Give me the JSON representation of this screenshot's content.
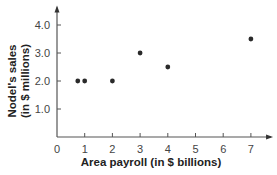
{
  "chart_data": {
    "type": "scatter",
    "title": "",
    "xlabel": "Area payroll (in $ billions)",
    "ylabel_line1": "Nodel's sales",
    "ylabel_line2": "(in $ millions)",
    "ylabel": "Nodel's sales (in $ millions)",
    "xlim": [
      0,
      7.8
    ],
    "ylim": [
      0,
      4.7
    ],
    "x_ticks": [
      0,
      1,
      2,
      3,
      4,
      5,
      6,
      7
    ],
    "x_tick_labels": [
      "0",
      "1",
      "2",
      "3",
      "4",
      "5",
      "6",
      "7"
    ],
    "y_ticks": [
      1.0,
      2.0,
      3.0,
      4.0
    ],
    "y_tick_labels": [
      "1.0",
      "2.0",
      "3.0",
      "4.0"
    ],
    "grid": false,
    "legend": null,
    "points": [
      {
        "x": 0.75,
        "y": 2.0
      },
      {
        "x": 1.0,
        "y": 2.0
      },
      {
        "x": 2.0,
        "y": 2.0
      },
      {
        "x": 3.0,
        "y": 3.0
      },
      {
        "x": 4.0,
        "y": 2.5
      },
      {
        "x": 7.0,
        "y": 3.5
      }
    ],
    "colors": {
      "axis": "#555555",
      "point": "#2a2a2a",
      "text": "#333333"
    }
  }
}
